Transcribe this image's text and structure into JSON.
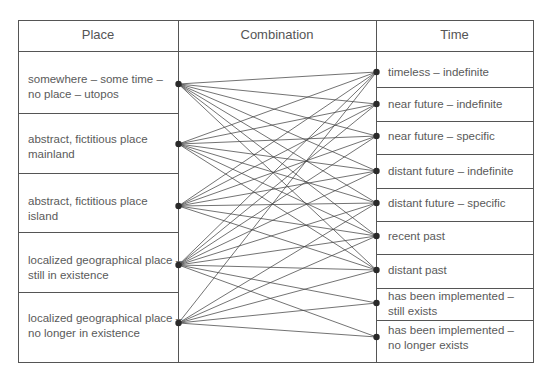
{
  "headers": {
    "place": "Place",
    "combination": "Combination",
    "time": "Time"
  },
  "colors": {
    "line": "#444444",
    "node": "#2a2a2a",
    "border": "#555555",
    "text": "#5a5a5a"
  },
  "place_items": [
    {
      "line1": "somewhere – some time –",
      "line2": "no place – utopos"
    },
    {
      "line1": "abstract, fictitious place",
      "line2": "mainland"
    },
    {
      "line1": "abstract, fictitious place",
      "line2": "island"
    },
    {
      "line1": "localized geographical place –",
      "line2": "still in existence"
    },
    {
      "line1": "localized geographical place –",
      "line2": "no longer in existence"
    }
  ],
  "time_items": [
    {
      "line1": "timeless – indefinite",
      "line2": ""
    },
    {
      "line1": "near future – indefinite",
      "line2": ""
    },
    {
      "line1": "near future – specific",
      "line2": ""
    },
    {
      "line1": "distant future – indefinite",
      "line2": ""
    },
    {
      "line1": "distant future – specific",
      "line2": ""
    },
    {
      "line1": "recent past",
      "line2": ""
    },
    {
      "line1": "distant past",
      "line2": ""
    },
    {
      "line1": "has been implemented –",
      "line2": "still exists"
    },
    {
      "line1": "has been implemented –",
      "line2": "no longer exists"
    }
  ],
  "connections": [
    [
      0,
      0
    ],
    [
      0,
      1
    ],
    [
      0,
      2
    ],
    [
      0,
      3
    ],
    [
      0,
      4
    ],
    [
      0,
      5
    ],
    [
      0,
      6
    ],
    [
      1,
      0
    ],
    [
      1,
      1
    ],
    [
      1,
      2
    ],
    [
      1,
      3
    ],
    [
      1,
      4
    ],
    [
      1,
      5
    ],
    [
      1,
      6
    ],
    [
      2,
      0
    ],
    [
      2,
      1
    ],
    [
      2,
      2
    ],
    [
      2,
      3
    ],
    [
      2,
      4
    ],
    [
      2,
      5
    ],
    [
      2,
      6
    ],
    [
      3,
      0
    ],
    [
      3,
      1
    ],
    [
      3,
      2
    ],
    [
      3,
      3
    ],
    [
      3,
      4
    ],
    [
      3,
      5
    ],
    [
      3,
      6
    ],
    [
      3,
      7
    ],
    [
      3,
      8
    ],
    [
      4,
      0
    ],
    [
      4,
      4
    ],
    [
      4,
      5
    ],
    [
      4,
      6
    ],
    [
      4,
      7
    ],
    [
      4,
      8
    ]
  ]
}
